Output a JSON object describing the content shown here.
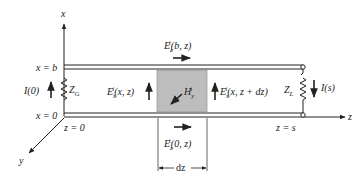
{
  "axes": {
    "x_label": "x",
    "y_label": "y",
    "z_label": "z"
  },
  "positions": {
    "x_b": "x = b",
    "x_0": "x = 0",
    "z_0": "z = 0",
    "z_s": "z = s"
  },
  "components": {
    "source_current": "I(0)",
    "generator_impedance": "Z",
    "generator_impedance_sub": "G",
    "load_impedance": "Z",
    "load_impedance_sub": "L",
    "load_current": "I(s)"
  },
  "fields": {
    "top_field_main": "E",
    "top_field_sub": "z",
    "top_field_sup": "i",
    "top_field_args": "(b, z)",
    "bottom_field_main": "E",
    "bottom_field_sub": "z",
    "bottom_field_sup": "i",
    "bottom_field_args": "(0, z)",
    "left_field_main": "E",
    "left_field_sub": "x",
    "left_field_sup": "i",
    "left_field_args": "(x, z)",
    "right_field_main": "E",
    "right_field_sub": "x",
    "right_field_sup": "i",
    "right_field_args": "(x, z + dz)",
    "magnetic_main": "H",
    "magnetic_sub": "y",
    "magnetic_sup": "i"
  },
  "dimension": {
    "label": "dz"
  },
  "colors": {
    "line": "#222222",
    "shaded_box": "#bdbdbd"
  }
}
